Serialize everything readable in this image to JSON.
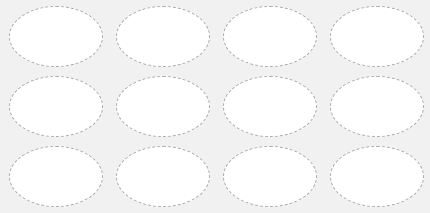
{
  "sheet": {
    "background": "#f1f1f1",
    "label_fill": "#ffffff",
    "label_border": "#a9a9a9",
    "rows": 3,
    "columns": 4,
    "labels": [
      {
        "row": 1,
        "col": 1,
        "text": ""
      },
      {
        "row": 1,
        "col": 2,
        "text": ""
      },
      {
        "row": 1,
        "col": 3,
        "text": ""
      },
      {
        "row": 1,
        "col": 4,
        "text": ""
      },
      {
        "row": 2,
        "col": 1,
        "text": ""
      },
      {
        "row": 2,
        "col": 2,
        "text": ""
      },
      {
        "row": 2,
        "col": 3,
        "text": ""
      },
      {
        "row": 2,
        "col": 4,
        "text": ""
      },
      {
        "row": 3,
        "col": 1,
        "text": ""
      },
      {
        "row": 3,
        "col": 2,
        "text": ""
      },
      {
        "row": 3,
        "col": 3,
        "text": ""
      },
      {
        "row": 3,
        "col": 4,
        "text": ""
      }
    ]
  }
}
